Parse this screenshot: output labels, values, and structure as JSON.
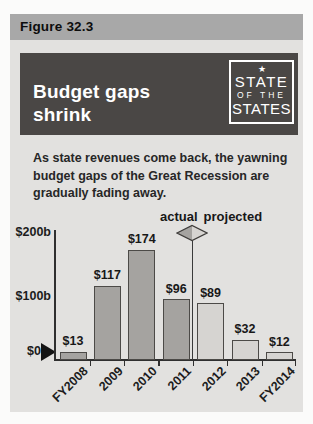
{
  "figure": {
    "label": "Figure 32.3"
  },
  "header": {
    "title": "Budget gaps\nshrink",
    "logo": {
      "star": "★",
      "line1": "STATE",
      "line2": "OF THE",
      "line3": "STATES"
    }
  },
  "subtitle": "As state revenues come back, the yawning\nbudget gaps of the Great Recession are\ngradually fading away.",
  "chart_data": {
    "type": "bar",
    "title": "Budget gaps shrink",
    "categories": [
      "FY2008",
      "2009",
      "2010",
      "2011",
      "2012",
      "2013",
      "FY2014"
    ],
    "values": [
      13,
      117,
      174,
      96,
      89,
      32,
      12
    ],
    "bar_labels": [
      "$13",
      "$117",
      "$174",
      "$96",
      "$89",
      "$32",
      "$12"
    ],
    "series_of_bar": [
      "actual",
      "actual",
      "actual",
      "actual",
      "projected",
      "projected",
      "projected"
    ],
    "legend": {
      "actual": "actual",
      "projected": "projected"
    },
    "ytick_labels": [
      "$200b",
      "$100b",
      "$0"
    ],
    "ylim": [
      0,
      200
    ],
    "divider_after_index": 3,
    "colors": {
      "actual": "#a5a3a0",
      "projected": "#d6d4d1",
      "axis": "#2f2f2f"
    }
  }
}
